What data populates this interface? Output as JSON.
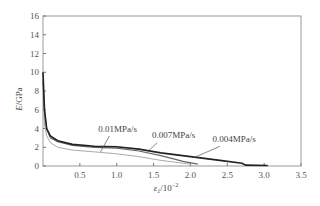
{
  "chart_data": {
    "type": "line",
    "title": "",
    "xlabel": "ε1/10^-2",
    "ylabel": "E/GPa",
    "xlim": [
      0,
      3.5
    ],
    "ylim": [
      0,
      16
    ],
    "xticks": [
      "0.5",
      "1.0",
      "1.5",
      "2.0",
      "2.5",
      "3.0",
      "3.5"
    ],
    "yticks": [
      "0",
      "2",
      "4",
      "6",
      "8",
      "10",
      "12",
      "14",
      "16"
    ],
    "grid": false,
    "series": [
      {
        "name": "0.004MPa/s",
        "color": "#222222",
        "x": [
          0.0,
          0.02,
          0.05,
          0.1,
          0.2,
          0.4,
          0.7,
          1.0,
          1.3,
          1.6,
          2.0,
          2.4,
          2.7,
          2.75,
          3.05
        ],
        "y": [
          10.0,
          6.0,
          4.0,
          3.2,
          2.7,
          2.3,
          2.1,
          2.05,
          1.8,
          1.4,
          1.0,
          0.6,
          0.3,
          0.1,
          0.05
        ]
      },
      {
        "name": "0.007MPa/s",
        "color": "#666666",
        "x": [
          0.0,
          0.02,
          0.05,
          0.1,
          0.2,
          0.4,
          0.7,
          1.0,
          1.3,
          1.6,
          1.9,
          2.1
        ],
        "y": [
          9.0,
          5.8,
          3.9,
          3.0,
          2.6,
          2.2,
          2.0,
          1.9,
          1.6,
          1.1,
          0.5,
          0.2
        ]
      },
      {
        "name": "0.01MPa/s",
        "color": "#aaaaaa",
        "x": [
          0.0,
          0.02,
          0.05,
          0.1,
          0.2,
          0.4,
          0.7,
          1.0,
          1.3,
          1.6,
          2.0
        ],
        "y": [
          8.0,
          4.5,
          3.2,
          2.5,
          2.0,
          1.7,
          1.5,
          1.3,
          1.0,
          0.6,
          0.2
        ]
      }
    ],
    "annotations": [
      {
        "text": "0.01MPa/s",
        "x": 0.75,
        "y": 3.6
      },
      {
        "text": "0.007MPa/s",
        "x": 1.48,
        "y": 3.0
      },
      {
        "text": "0.004MPa/s",
        "x": 2.3,
        "y": 2.6
      }
    ]
  }
}
